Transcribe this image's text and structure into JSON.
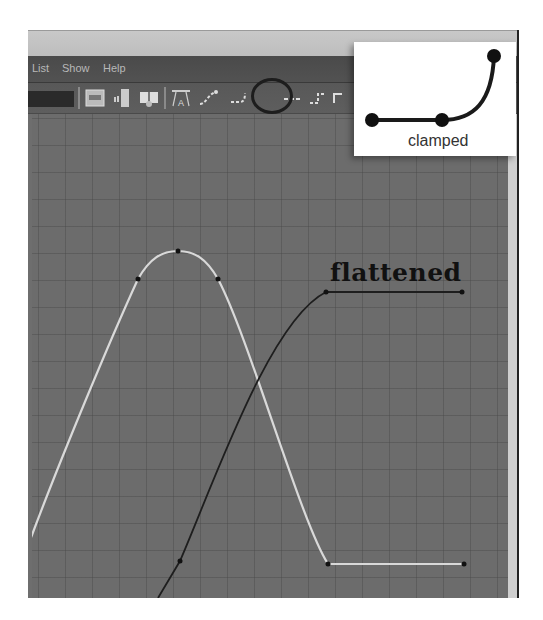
{
  "menu": {
    "items": [
      {
        "label": "List"
      },
      {
        "label": "Show"
      },
      {
        "label": "Help"
      }
    ]
  },
  "toolbar": {
    "icons": [
      "frame-all-icon",
      "frame-selected-icon",
      "frame-playback-icon",
      "normalize-icon",
      "spline-tangent-icon",
      "clamped-tangent-icon",
      "linear-tangent-icon",
      "flat-tangent-icon",
      "step-tangent-icon"
    ],
    "highlighted_icon": "clamped-tangent-icon"
  },
  "annotations": {
    "flattened_label": "flattened",
    "callout_label": "clamped"
  },
  "graph_editor": {
    "curves": [
      {
        "name": "light-curve",
        "color": "#d9d9d9",
        "keys": [
          [
            138,
            279
          ],
          [
            178,
            251
          ],
          [
            218,
            279
          ],
          [
            328,
            564
          ],
          [
            464,
            564
          ]
        ]
      },
      {
        "name": "dark-curve",
        "color": "#1e1e1e",
        "keys": [
          [
            180,
            561
          ],
          [
            326,
            292
          ],
          [
            462,
            292
          ]
        ]
      }
    ]
  },
  "colors": {
    "graph_bg": "#6c6c6c",
    "menubar_bg": "#4e4e4e",
    "titlebar_bg": "#c4c4c4",
    "highlight_ring": "#1d1d1d"
  }
}
